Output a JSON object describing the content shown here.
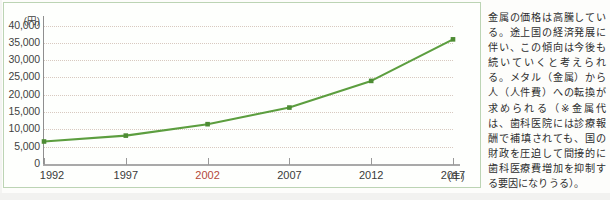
{
  "chart_data": {
    "type": "line",
    "title": "",
    "subtitle": "",
    "xlabel": "(年)",
    "ylabel": "(円)",
    "categories": [
      "1992",
      "1997",
      "2002",
      "2007",
      "2012",
      "2017"
    ],
    "values": [
      6500,
      8200,
      11500,
      16300,
      24000,
      36000
    ],
    "series": [
      {
        "name": "金属価格",
        "values": [
          6500,
          8200,
          11500,
          16300,
          24000,
          36000
        ]
      }
    ],
    "ylim": [
      0,
      40000
    ],
    "ytick_labels": [
      "40,000",
      "35,000",
      "30,000",
      "25,000",
      "20,000",
      "15,000",
      "10,000",
      "5,000",
      "0"
    ],
    "ytick_values": [
      40000,
      35000,
      30000,
      25000,
      20000,
      15000,
      10000,
      5000,
      0
    ],
    "grid": true,
    "legend_position": "none",
    "line_color": "#5c9e3f",
    "marker_color": "#4d8c33",
    "grid_color": "#d8c9c0",
    "axis_color": "#9a9a9a",
    "highlighted_category": "2002"
  },
  "chart": {
    "y_axis_unit": "(円)",
    "x_axis_unit": "(年)"
  },
  "commentary": {
    "text": "金属の価格は高騰している。途上国の経済発展に伴い、この傾向は今後も続いていくと考えられる。メタル（金属）から人（人件費）への転換が求められる（※金属代は、歯科医院には診療報酬で補填されても、国の財政を圧迫して間接的に歯科医療費増加を抑制する要因になりうる）。"
  },
  "colors": {
    "panel_border": "#bcd4b4",
    "line": "#5c9e3f",
    "accent_label": "#b4483a",
    "text": "#2e2e2e"
  }
}
